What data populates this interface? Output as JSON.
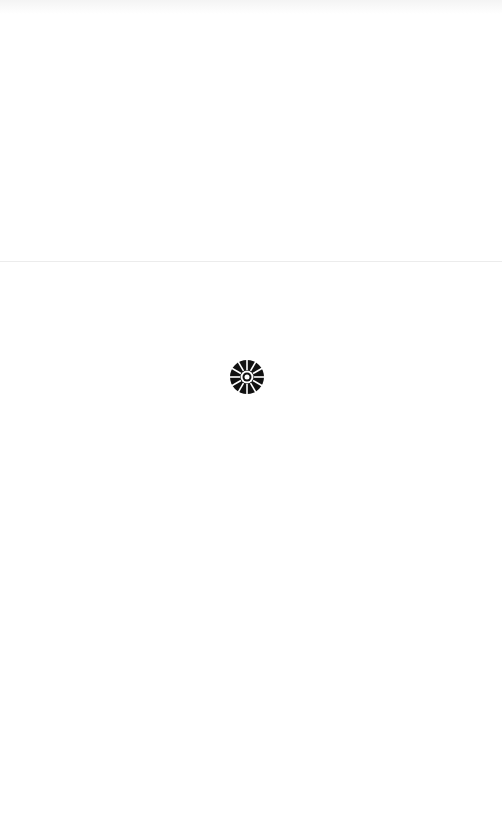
{
  "screen": {
    "state": "loading",
    "background_color": "#ffffff",
    "divider_color": "#ececec"
  },
  "loader": {
    "icon": "loading-spinner-icon",
    "color": "#111111",
    "label": "Loading"
  }
}
